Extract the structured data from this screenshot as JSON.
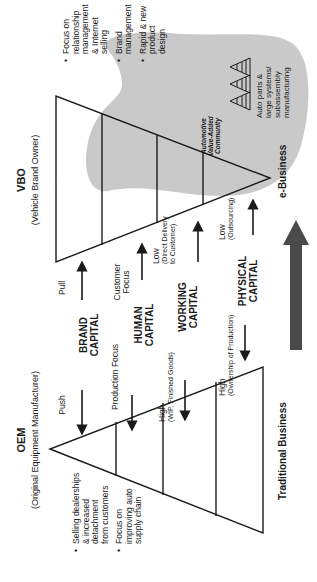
{
  "oem": {
    "title": "OEM",
    "subtitle": "(Original Equipment Manufacturer)",
    "bullets": [
      [
        "Selling dealerships",
        "& increased",
        "detachment",
        "from customers"
      ],
      [
        "Focus on",
        "improving auto",
        "supply chain"
      ]
    ]
  },
  "vbo": {
    "title": "VBO",
    "subtitle": "(Vehicle Brand Owner)",
    "bullets": [
      [
        "Focus on",
        "relationship",
        "management",
        "& Internet",
        "selling"
      ],
      [
        "Brand",
        "management"
      ],
      [
        "Rapid & new",
        "product",
        "design"
      ]
    ]
  },
  "rows": {
    "brand": {
      "left_label": "Push",
      "capital": [
        "BRAND",
        "CAPITAL"
      ],
      "right_label": "Pull"
    },
    "human": {
      "left_label": "Production Focus",
      "capital": [
        "HUMAN",
        "CAPITAL"
      ],
      "right_label": [
        "Customer",
        "Focus"
      ]
    },
    "working": {
      "left_label": "High",
      "left_sub": "(WIP, Finished Goods)",
      "capital": [
        "WORKING",
        "CAPITAL"
      ],
      "right_label": "Low",
      "right_sub": [
        "(Direct Delivery",
        "to Customer)"
      ]
    },
    "physical": {
      "left_label": "High",
      "left_sub": "(Ownership of Production)",
      "capital": [
        "PHYSICAL",
        "CAPITAL"
      ],
      "right_label": "Low",
      "right_sub": "(Outsourcing)"
    }
  },
  "community": {
    "label": [
      "Automotive",
      "Value-Added",
      "Community"
    ],
    "parts": [
      "Auto parts &",
      "large systems/",
      "subassembly",
      "manufacturing"
    ]
  },
  "bottom": {
    "left": "Traditional Business",
    "right": "e-Business"
  },
  "colors": {
    "line": "#1a1a1a",
    "blob": "#c9c9c9",
    "big_arrow": "#4a4a4a"
  }
}
